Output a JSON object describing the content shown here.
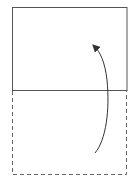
{
  "diagram": {
    "type": "folding-instruction",
    "colors": {
      "background": "#ffffff",
      "solid_line": "#555555",
      "dashed_line": "#666666",
      "arrow": "#333333"
    },
    "paper_top": {
      "x": 12,
      "y": 7,
      "width": 115,
      "height": 83,
      "style": "solid"
    },
    "fold_line": {
      "x1": 12,
      "y1": 90,
      "x2": 127,
      "y2": 90
    },
    "paper_bottom": {
      "x": 12,
      "y": 90,
      "width": 115,
      "height": 84,
      "style": "dashed"
    },
    "arrow": {
      "from": [
        95,
        153
      ],
      "to": [
        94,
        45
      ],
      "direction": "up"
    }
  }
}
